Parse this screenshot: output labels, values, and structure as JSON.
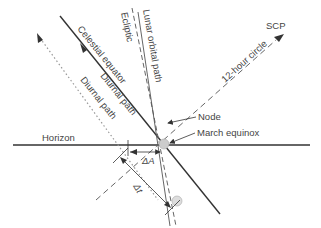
{
  "diagram": {
    "colors": {
      "line": "#333333",
      "dashed": "#666666",
      "dotted": "#999999",
      "text": "#444444",
      "marker": "#cccccc"
    },
    "labels": {
      "horizon": "Horizon",
      "celestial_equator": "Celestial equator",
      "diurnal_path_1": "Diurnal path",
      "diurnal_path_2": "Diurnal path",
      "ecliptic": "Ecliptic",
      "lunar_orbital_path": "Lunar orbital path",
      "twelve_hour_circle": "12-hour circle",
      "scp": "SCP",
      "node": "Node",
      "march_equinox": "March equinox",
      "delta_a": "ΔA",
      "delta_t": "Δt"
    }
  }
}
